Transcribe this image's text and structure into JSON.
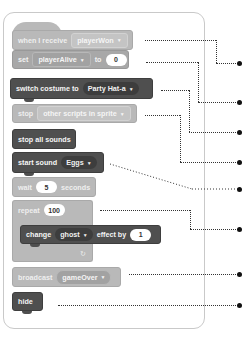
{
  "script": {
    "blocks": [
      {
        "id": "when-receive",
        "text": "when I receive",
        "dropdown": "playerWon"
      },
      {
        "id": "set-var",
        "text": "set",
        "dropdown": "playerAlive",
        "text2": "to",
        "value": "0"
      },
      {
        "id": "switch-costume",
        "text": "switch costume to",
        "dropdown": "Party Hat-a"
      },
      {
        "id": "stop",
        "text": "stop",
        "dropdown": "other scripts in sprite"
      },
      {
        "id": "stop-all-sounds",
        "text": "stop all sounds"
      },
      {
        "id": "start-sound",
        "text": "start sound",
        "dropdown": "Eggs"
      },
      {
        "id": "wait",
        "text": "wait",
        "value": "5",
        "text2": "seconds"
      },
      {
        "id": "repeat",
        "text": "repeat",
        "value": "100",
        "loop_icon": "↻"
      },
      {
        "id": "change-effect",
        "text": "change",
        "dropdown": "ghost",
        "text2": "effect by",
        "value": "1"
      },
      {
        "id": "broadcast",
        "text": "broadcast",
        "dropdown": "gameOver"
      },
      {
        "id": "hide",
        "text": "hide"
      }
    ],
    "dropdown_arrow": "▼"
  },
  "colors": {
    "light_block": "#b9b9b9",
    "mid_block": "#a8a8a8",
    "dark_block": "#4f4f4f",
    "panel_border": "#c9c9c9",
    "connector": "#111111"
  }
}
